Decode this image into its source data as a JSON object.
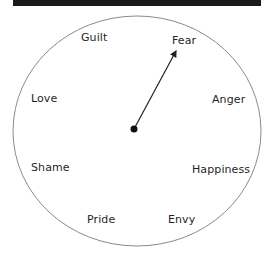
{
  "diagram": {
    "type": "emotion-dial",
    "colors": {
      "background": "#ffffff",
      "top_bar": "#1a1a1a",
      "circle_stroke": "#8a8a8a",
      "needle": "#222222",
      "label_text": "#1f1f1f"
    },
    "labels": {
      "guilt": "Guilt",
      "fear": "Fear",
      "love": "Love",
      "anger": "Anger",
      "shame": "Shame",
      "happiness": "Happiness",
      "pride": "Pride",
      "envy": "Envy"
    },
    "needle": {
      "points_to": "Fear"
    }
  }
}
